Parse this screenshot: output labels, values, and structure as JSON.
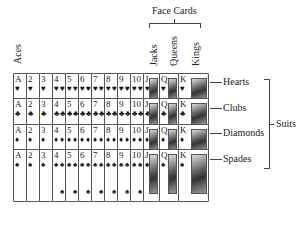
{
  "labels": {
    "aces": "Aces",
    "face_cards": "Face Cards",
    "jacks": "Jacks",
    "queens": "Queens",
    "kings": "Kings",
    "suits": "Suits"
  },
  "ranks": [
    "A",
    "2",
    "3",
    "4",
    "5",
    "6",
    "7",
    "8",
    "9",
    "10",
    "J",
    "Q",
    "K"
  ],
  "rows": [
    {
      "suit": "Hearts",
      "symbol": "♥"
    },
    {
      "suit": "Clubs",
      "symbol": "♣"
    },
    {
      "suit": "Diamonds",
      "symbol": "♦"
    },
    {
      "suit": "Spades",
      "symbol": "♠"
    }
  ]
}
